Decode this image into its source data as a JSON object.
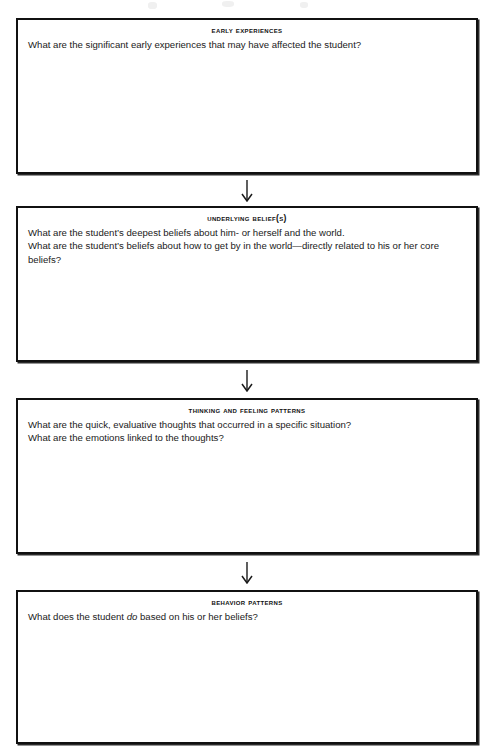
{
  "document": {
    "type": "case-conceptualization-worksheet",
    "orientation": "vertical-flow",
    "box_count": 4,
    "connector": "down-arrow"
  },
  "boxes": [
    {
      "id": "early-experiences",
      "title": "Early Experiences",
      "lines": [
        "What are the significant early experiences that may have affected the student?"
      ]
    },
    {
      "id": "underlying-beliefs",
      "title": "Underlying Belief(s)",
      "lines": [
        "What are the student’s deepest beliefs about him- or herself and the world.",
        "What are the student’s beliefs about how to get by in the world—directly related to his or her core beliefs?"
      ]
    },
    {
      "id": "thinking-and-feeling-patterns",
      "title": "Thinking and Feeling Patterns",
      "lines": [
        "What are the quick, evaluative thoughts that occurred in a specific situation?",
        "What are the emotions linked to the thoughts?"
      ]
    },
    {
      "id": "behavior-patterns",
      "title": "Behavior Patterns",
      "lines_html": [
        "What does the student <em>do</em> based on his or her beliefs?"
      ]
    }
  ],
  "arrows": [
    {
      "id": "arrow-1",
      "from": "early-experiences",
      "to": "underlying-beliefs",
      "glyph": "down-arrow"
    },
    {
      "id": "arrow-2",
      "from": "underlying-beliefs",
      "to": "thinking-and-feeling-patterns",
      "glyph": "down-arrow"
    },
    {
      "id": "arrow-3",
      "from": "thinking-and-feeling-patterns",
      "to": "behavior-patterns",
      "glyph": "down-arrow"
    }
  ],
  "colors": {
    "border": "#111111",
    "text": "#1a1a1a",
    "background": "#ffffff"
  }
}
